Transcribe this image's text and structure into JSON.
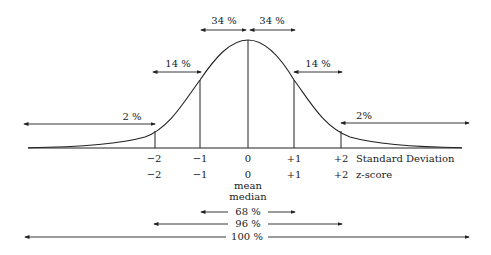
{
  "diagram": {
    "type": "normal_distribution_curve",
    "top_arrows": [
      {
        "label": "34 %",
        "from": "0 SD",
        "to": "-1 SD"
      },
      {
        "label": "34 %",
        "from": "0 SD",
        "to": "+1 SD"
      },
      {
        "label": "14 %",
        "region": "-2 to -1 SD"
      },
      {
        "label": "14 %",
        "region": "+1 to +2 SD"
      },
      {
        "label": "2 %",
        "region": "< -2 SD"
      },
      {
        "label": "2%",
        "region": "> +2 SD"
      }
    ],
    "axis_rows": {
      "standard_deviation": {
        "ticks": [
          "−2",
          "−1",
          "0",
          "+1",
          "+2"
        ],
        "label": "Standard Deviation"
      },
      "z_score": {
        "ticks": [
          "−2",
          "−1",
          "0",
          "+1",
          "+2"
        ],
        "label": "z-score"
      }
    },
    "center_labels": [
      "mean",
      "median"
    ],
    "bottom_ranges": [
      {
        "label": "68 %",
        "span": "±1 SD"
      },
      {
        "label": "96 %",
        "span": "±2 SD"
      },
      {
        "label": "100 %",
        "span": "all"
      }
    ],
    "colors": {
      "line": "#222222",
      "background": "#ffffff"
    }
  }
}
